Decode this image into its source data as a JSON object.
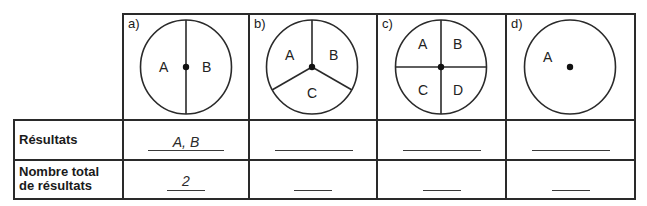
{
  "table": {
    "columns": [
      {
        "label": "a)",
        "sectors": 2,
        "regions": [
          "A",
          "B"
        ]
      },
      {
        "label": "b)",
        "sectors": 3,
        "regions": [
          "A",
          "B",
          "C"
        ]
      },
      {
        "label": "c)",
        "sectors": 4,
        "regions": [
          "A",
          "B",
          "C",
          "D"
        ]
      },
      {
        "label": "d)",
        "sectors": 1,
        "regions": [
          "A"
        ]
      }
    ],
    "rows": [
      {
        "header": "Résultats",
        "values": [
          "A, B",
          "",
          "",
          ""
        ]
      },
      {
        "header_line1": "Nombre total",
        "header_line2": "de résultats",
        "values": [
          "2",
          "",
          "",
          ""
        ]
      }
    ]
  }
}
